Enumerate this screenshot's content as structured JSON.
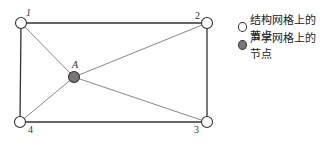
{
  "diagram": {
    "nodes": [
      {
        "id": "1",
        "label": "1",
        "type": "structural",
        "x": 21,
        "y": 23
      },
      {
        "id": "2",
        "label": "2",
        "type": "structural",
        "x": 207,
        "y": 23
      },
      {
        "id": "3",
        "label": "3",
        "type": "structural",
        "x": 207,
        "y": 122
      },
      {
        "id": "4",
        "label": "4",
        "type": "structural",
        "x": 20,
        "y": 122
      },
      {
        "id": "A",
        "label": "A",
        "type": "acoustic",
        "x": 74,
        "y": 77
      }
    ],
    "edges": [
      [
        "1",
        "2"
      ],
      [
        "2",
        "3"
      ],
      [
        "3",
        "4"
      ],
      [
        "4",
        "1"
      ],
      [
        "A",
        "1"
      ],
      [
        "A",
        "2"
      ],
      [
        "A",
        "3"
      ],
      [
        "A",
        "4"
      ]
    ]
  },
  "legend": {
    "structural": "结构网格上的节点",
    "acoustic": "声学网格上的节点"
  },
  "colors": {
    "outer_edge": "#333333",
    "inner_edge": "#888888",
    "acoustic_fill": "#777777"
  }
}
